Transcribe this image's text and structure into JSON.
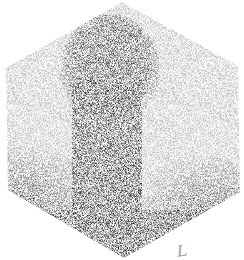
{
  "image": {
    "kind": "nuclear-medicine-scintigram",
    "palette": {
      "background": "#ffffff",
      "uptake": "#000000"
    },
    "annotation_mark": "L"
  }
}
